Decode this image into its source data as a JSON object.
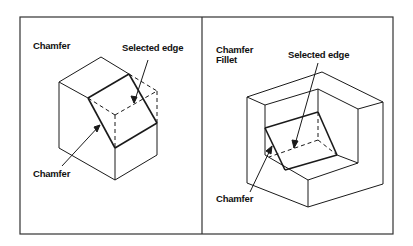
{
  "panels": [
    {
      "title": "Chamfer",
      "callouts": {
        "selected_edge": "Selected edge",
        "chamfer": "Chamfer"
      }
    },
    {
      "title_line1": "Chamfer",
      "title_line2": "Fillet",
      "callouts": {
        "selected_edge": "Selected edge",
        "chamfer": "Chamfer"
      }
    }
  ],
  "colors": {
    "line": "#1a1a1a",
    "frame": "#333333",
    "background": "#ffffff"
  }
}
